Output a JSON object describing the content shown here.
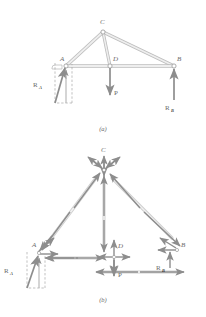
{
  "figure": {
    "title_a": "(a)",
    "title_b": "(b)",
    "colors": {
      "member": "#d9d9d9",
      "member_edge": "#bdbdbd",
      "arrow": "#8d8d8d",
      "label": "#6b6b6b",
      "dashed": "#a8a8a8"
    }
  },
  "panel_a": {
    "caption": "(a)",
    "nodes": [
      {
        "id": "A",
        "label": "A",
        "x": 66,
        "y": 66
      },
      {
        "id": "C",
        "label": "C",
        "x": 103,
        "y": 32
      },
      {
        "id": "B",
        "label": "B",
        "x": 174,
        "y": 66
      },
      {
        "id": "D",
        "label": "D",
        "x": 110,
        "y": 66
      }
    ],
    "members": [
      {
        "from": "A",
        "to": "C"
      },
      {
        "from": "C",
        "to": "B"
      },
      {
        "from": "A",
        "to": "B"
      },
      {
        "from": "C",
        "to": "D"
      }
    ],
    "forces": [
      {
        "name": "P",
        "label": "P",
        "at": "D",
        "dir": "down",
        "label_x": 116,
        "label_y": 92
      },
      {
        "name": "R_B",
        "label": "R",
        "sub": "B",
        "at": "B",
        "dir": "up",
        "label_x": 167,
        "label_y": 108
      },
      {
        "name": "R_A",
        "label": "R",
        "sub": "A",
        "at": "A",
        "dir": "up-right-incline",
        "label_x": 34,
        "label_y": 86
      }
    ],
    "support_construction": {
      "type": "dashed-rectangle",
      "description": "dashed box showing components of R_A at A"
    }
  },
  "panel_b": {
    "caption": "(b)",
    "nodes": [
      {
        "id": "A",
        "label": "A",
        "x": 39,
        "y": 250
      },
      {
        "id": "C",
        "label": "C",
        "x": 104,
        "y": 168
      },
      {
        "id": "B",
        "label": "B",
        "x": 178,
        "y": 248
      },
      {
        "id": "D",
        "label": "D",
        "x": 112,
        "y": 252
      }
    ],
    "exploded_members": [
      {
        "from": "A",
        "to": "C",
        "type": "two-force-compression"
      },
      {
        "from": "C",
        "to": "B",
        "type": "two-force-compression"
      },
      {
        "from": "C",
        "to": "D",
        "type": "two-force-compression"
      },
      {
        "from": "A",
        "to": "D",
        "type": "two-force-tension"
      },
      {
        "from": "D",
        "to": "B",
        "type": "two-force-tension"
      }
    ],
    "forces": [
      {
        "name": "P",
        "label": "P",
        "at": "D",
        "dir": "down",
        "label_x": 119,
        "label_y": 274
      },
      {
        "name": "R_B",
        "label": "R",
        "sub": "B",
        "at": "B",
        "dir": "up",
        "label_x": 157,
        "label_y": 268
      },
      {
        "name": "R_A",
        "label": "R",
        "sub": "A",
        "at": "A",
        "dir": "up-right-incline",
        "label_x": 6,
        "label_y": 272
      }
    ],
    "node_force_crosses": [
      {
        "node": "C",
        "arrows": [
          "up",
          "down",
          "up-left",
          "up-right",
          "down-left",
          "down-right"
        ]
      },
      {
        "node": "D",
        "arrows": [
          "up",
          "down",
          "left",
          "right"
        ]
      },
      {
        "node": "A",
        "arrows": [
          "right",
          "up-right",
          "down-left"
        ]
      },
      {
        "node": "B",
        "arrows": [
          "up",
          "left",
          "up-left"
        ]
      }
    ]
  }
}
